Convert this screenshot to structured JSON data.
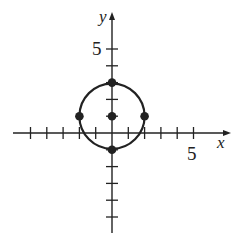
{
  "chart_data": {
    "type": "scatter",
    "title": "",
    "xlabel": "x",
    "ylabel": "y",
    "xlim": [
      -5,
      5
    ],
    "ylim": [
      -5,
      5
    ],
    "x_tick_label": "5",
    "y_tick_label": "5",
    "grid": false,
    "circle": {
      "center": [
        0,
        1
      ],
      "radius": 2
    },
    "points": [
      {
        "x": 0,
        "y": 3
      },
      {
        "x": -2,
        "y": 1
      },
      {
        "x": 0,
        "y": 1
      },
      {
        "x": 2,
        "y": 1
      },
      {
        "x": 0,
        "y": -1
      }
    ],
    "colors": {
      "stroke": "#222222",
      "background": "#ffffff"
    }
  }
}
